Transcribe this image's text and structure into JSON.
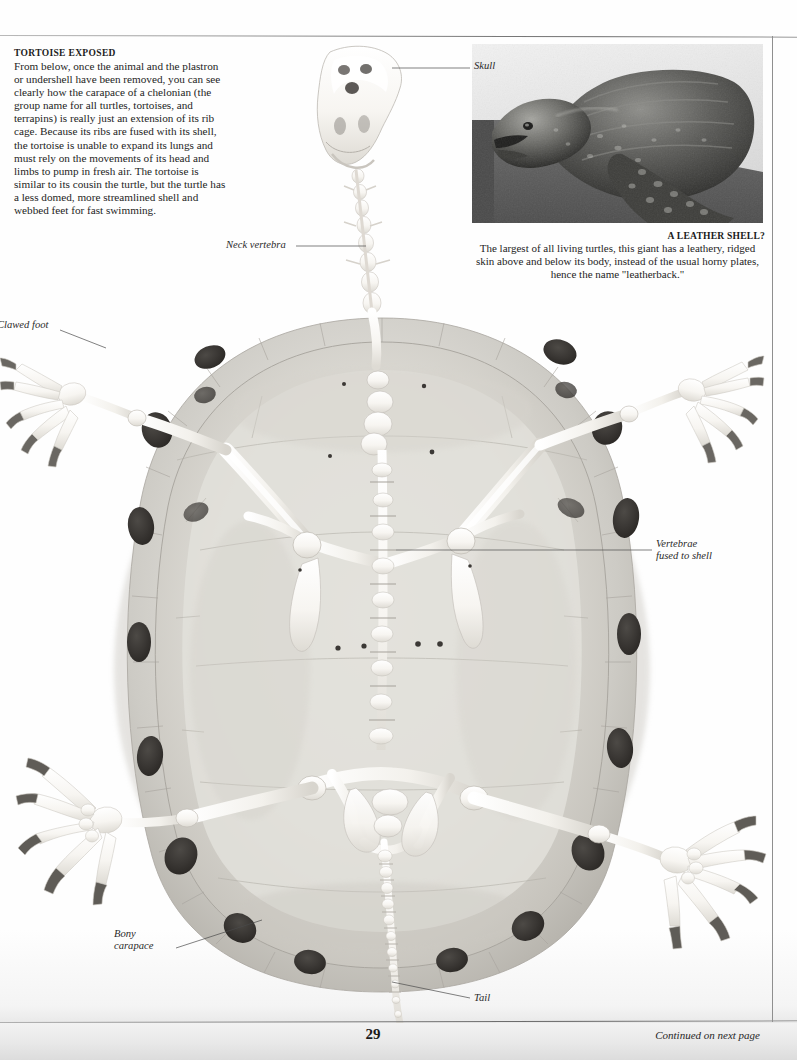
{
  "page": {
    "number": "29",
    "continued": "Continued on next page"
  },
  "intro": {
    "heading": "TORTOISE EXPOSED",
    "body": "From below, once the animal and the plastron or undershell have been removed, you can see clearly how the carapace of a chelonian (the group name for all turtles, tortoises, and terrapins) is really just an extension of its rib cage. Because its ribs are fused with its shell, the tortoise is unable to expand its lungs and must rely on the movements of its head and limbs to pump in fresh air. The tortoise is similar to its cousin the turtle, but the turtle has a less domed, more streamlined shell and webbed feet for fast swimming."
  },
  "leatherback": {
    "caption_heading": "A LEATHER SHELL?",
    "caption_body": "The largest of all living turtles, this giant has a leathery, ridged skin above and below its body, instead of the usual horny plates, hence the name \"leatherback.\"",
    "photo_alt": "leatherback-turtle-photo"
  },
  "labels": {
    "skull": "Skull",
    "neck_vertebra": "Neck vertebra",
    "clawed_foot": "Clawed foot",
    "vertebrae_line1": "Vertebrae",
    "vertebrae_line2": "fused to shell",
    "bony_line1": "Bony",
    "bony_line2": "carapace",
    "tail": "Tail"
  },
  "colors": {
    "page_background": "#fefefe",
    "text": "#242424",
    "heading": "#1c1c1c",
    "leader_line": "#4a4a4a",
    "shell_light": "#e4e2de",
    "shell_mid": "#cfcdc8",
    "shell_shadow": "#b2afa9",
    "bone_white": "#fbfaf7",
    "scute_dark": "#3a3734",
    "photo_dark": "#2e2e2e",
    "photo_background": "#5d5d5d"
  }
}
